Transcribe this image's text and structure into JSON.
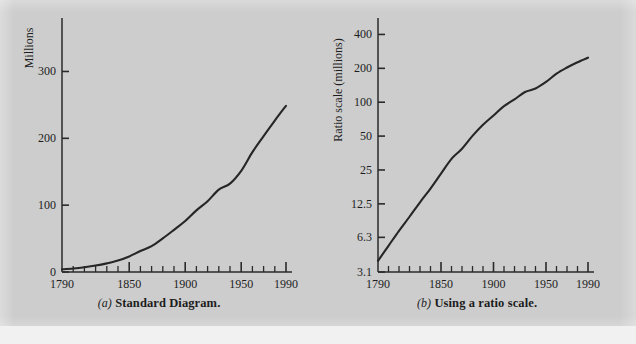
{
  "figure": {
    "background_color": "#cdcdcd",
    "ink_color": "#262626"
  },
  "panels": [
    {
      "id": "a",
      "caption_label": "(a)",
      "caption_text": "Standard Diagram."
    },
    {
      "id": "b",
      "caption_label": "(b)",
      "caption_text": "Using a ratio scale."
    }
  ],
  "chart_data": [
    {
      "type": "line",
      "title": "",
      "panel": "(a) Standard Diagram.",
      "xlabel": "",
      "ylabel": "Millions",
      "yscale": "linear",
      "xlim": [
        1790,
        1990
      ],
      "ylim": [
        0,
        380
      ],
      "grid": false,
      "legend": "none",
      "xticks": [
        1790,
        1850,
        1900,
        1950,
        1990
      ],
      "xticklabels": [
        "1790",
        "1850",
        "1900",
        "1950",
        "1990"
      ],
      "xminorticks": [
        1800,
        1810,
        1820,
        1830,
        1840,
        1860,
        1870,
        1880,
        1890,
        1910,
        1920,
        1930,
        1940,
        1960,
        1970,
        1980
      ],
      "yticks": [
        0,
        100,
        200,
        300
      ],
      "yticklabels": [
        "0",
        "100",
        "200",
        "300"
      ],
      "x": [
        1790,
        1800,
        1810,
        1820,
        1830,
        1840,
        1850,
        1860,
        1870,
        1880,
        1890,
        1900,
        1910,
        1920,
        1930,
        1940,
        1950,
        1960,
        1970,
        1980,
        1990
      ],
      "values": [
        3.9,
        5.3,
        7.2,
        9.6,
        12.9,
        17.1,
        23.2,
        31.4,
        38.6,
        50.2,
        63.0,
        76.2,
        92.2,
        106.0,
        123.2,
        132.2,
        151.3,
        179.3,
        203.3,
        226.5,
        248.7
      ]
    },
    {
      "type": "line",
      "title": "",
      "panel": "(b) Using a ratio scale.",
      "xlabel": "",
      "ylabel": "Ratio scale (millions)",
      "yscale": "log",
      "xlim": [
        1790,
        1990
      ],
      "ylim": [
        3.1,
        560
      ],
      "grid": false,
      "legend": "none",
      "xticks": [
        1790,
        1850,
        1900,
        1950,
        1990
      ],
      "xticklabels": [
        "1790",
        "1850",
        "1900",
        "1950",
        "1990"
      ],
      "xminorticks": [
        1800,
        1810,
        1820,
        1830,
        1840,
        1860,
        1870,
        1880,
        1890,
        1910,
        1920,
        1930,
        1940,
        1960,
        1970,
        1980
      ],
      "yticks": [
        3.1,
        6.3,
        12.5,
        25,
        50,
        100,
        200,
        400
      ],
      "yticklabels": [
        "3.1",
        "6.3",
        "12.5",
        "25",
        "50",
        "100",
        "200",
        "400"
      ],
      "x": [
        1790,
        1800,
        1810,
        1820,
        1830,
        1840,
        1850,
        1860,
        1870,
        1880,
        1890,
        1900,
        1910,
        1920,
        1930,
        1940,
        1950,
        1960,
        1970,
        1980,
        1990
      ],
      "values": [
        3.9,
        5.3,
        7.2,
        9.6,
        12.9,
        17.1,
        23.2,
        31.4,
        38.6,
        50.2,
        63.0,
        76.2,
        92.2,
        106.0,
        123.2,
        132.2,
        151.3,
        179.3,
        203.3,
        226.5,
        248.7
      ]
    }
  ]
}
